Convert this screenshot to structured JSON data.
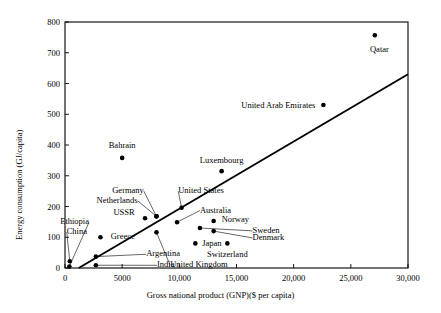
{
  "chart_data": {
    "type": "scatter",
    "title": "",
    "xlabel": "Gross national product (GNP)($ per capita)",
    "ylabel": "Energy consumption (GJ/capita)",
    "xlim": [
      0,
      30000
    ],
    "ylim": [
      0,
      800
    ],
    "xticks": [
      0,
      5000,
      10000,
      15000,
      20000,
      25000,
      30000
    ],
    "xticklabels": [
      "0",
      "5000",
      "10,000",
      "15,000",
      "20,000",
      "25,000",
      "30,000"
    ],
    "yticks": [
      0,
      100,
      200,
      300,
      400,
      500,
      600,
      700,
      800
    ],
    "yticklabels": [
      "0",
      "100",
      "200",
      "300",
      "400",
      "500",
      "600",
      "700",
      "800"
    ],
    "grid": false,
    "legend": "none",
    "marker_color": "#000000",
    "line_color": "#000000",
    "frame_color": "#000000",
    "trendline": {
      "x": [
        1200,
        30000
      ],
      "y": [
        0,
        630
      ]
    },
    "points": [
      {
        "name": "Ethiopia",
        "x": 380,
        "y": 5,
        "label_x": 2100,
        "label_y": 152,
        "leader": true,
        "anchor": "end"
      },
      {
        "name": "China",
        "x": 420,
        "y": 22,
        "label_x": 150,
        "label_y": 120,
        "leader": true,
        "anchor": "start"
      },
      {
        "name": "India",
        "x": 2700,
        "y": 9,
        "label_x": 8050,
        "label_y": 12,
        "leader": true,
        "anchor": "start"
      },
      {
        "name": "Argentina",
        "x": 2700,
        "y": 37,
        "label_x": 7100,
        "label_y": 48,
        "leader": true,
        "anchor": "start"
      },
      {
        "name": "Greece",
        "x": 3100,
        "y": 100,
        "label_x": 4000,
        "label_y": 104,
        "leader": false,
        "anchor": "start"
      },
      {
        "name": "Bahrain",
        "x": 5000,
        "y": 358,
        "label_x": 5000,
        "label_y": 400,
        "leader": false,
        "anchor": "middle"
      },
      {
        "name": "USSR",
        "x": 7000,
        "y": 162,
        "label_x": 6100,
        "label_y": 183,
        "leader": false,
        "anchor": "end"
      },
      {
        "name": "Germany",
        "x": 8000,
        "y": 168,
        "label_x": 6900,
        "label_y": 253,
        "leader": true,
        "anchor": "end"
      },
      {
        "name": "Netherlands",
        "x": 8000,
        "y": 168,
        "label_x": 6350,
        "label_y": 222,
        "leader": true,
        "anchor": "end"
      },
      {
        "name": "United Kingdom",
        "x": 8000,
        "y": 116,
        "label_x": 9200,
        "label_y": 12,
        "leader": true,
        "anchor": "start"
      },
      {
        "name": "Australia",
        "x": 9800,
        "y": 149,
        "label_x": 11800,
        "label_y": 190,
        "leader": true,
        "anchor": "start"
      },
      {
        "name": "United States",
        "x": 10200,
        "y": 196,
        "label_x": 9900,
        "label_y": 253,
        "leader": true,
        "anchor": "start"
      },
      {
        "name": "Japan",
        "x": 11400,
        "y": 80,
        "label_x": 12000,
        "label_y": 82,
        "leader": false,
        "anchor": "start"
      },
      {
        "name": "Sweden",
        "x": 11800,
        "y": 130,
        "label_x": 16400,
        "label_y": 124,
        "leader": true,
        "anchor": "start"
      },
      {
        "name": "Denmark",
        "x": 13000,
        "y": 120,
        "label_x": 16400,
        "label_y": 101,
        "leader": true,
        "anchor": "start"
      },
      {
        "name": "Norway",
        "x": 13000,
        "y": 153,
        "label_x": 13700,
        "label_y": 160,
        "leader": false,
        "anchor": "start"
      },
      {
        "name": "Luxembourg",
        "x": 13700,
        "y": 315,
        "label_x": 13700,
        "label_y": 352,
        "leader": false,
        "anchor": "middle"
      },
      {
        "name": "Switzerland",
        "x": 14200,
        "y": 80,
        "label_x": 14200,
        "label_y": 46,
        "leader": false,
        "anchor": "middle"
      },
      {
        "name": "United Arab Emirates",
        "x": 22600,
        "y": 530,
        "label_x": 21900,
        "label_y": 530,
        "leader": false,
        "anchor": "end"
      },
      {
        "name": "Qatar",
        "x": 27100,
        "y": 757,
        "label_x": 27500,
        "label_y": 712,
        "leader": false,
        "anchor": "middle"
      }
    ]
  }
}
